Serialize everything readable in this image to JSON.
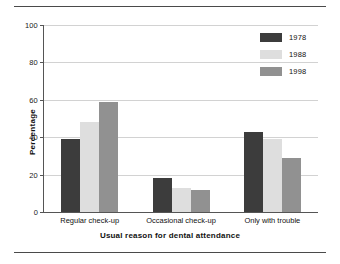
{
  "chart_data": {
    "type": "bar",
    "title": "",
    "xlabel": "Usual reason for dental attendance",
    "ylabel": "Percentage",
    "categories": [
      "Regular check-up",
      "Occasional check-up",
      "Only with trouble"
    ],
    "series": [
      {
        "name": "1978",
        "color": "#3c3c3c",
        "values": [
          39,
          18,
          43
        ]
      },
      {
        "name": "1988",
        "color": "#dedede",
        "values": [
          48,
          13,
          39
        ]
      },
      {
        "name": "1998",
        "color": "#919191",
        "values": [
          59,
          12,
          29
        ]
      }
    ],
    "ylim": [
      0,
      100
    ],
    "yticks": [
      0,
      20,
      40,
      60,
      80,
      100
    ],
    "ytick_labels": [
      "0",
      "20",
      "40",
      "60",
      "80",
      "100"
    ],
    "grid": "horizontal",
    "legend_position": "top-right"
  }
}
